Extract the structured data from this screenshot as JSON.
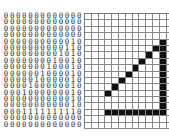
{
  "figure": {
    "rows": [
      "0000000000000",
      "0000000000000",
      "0000000000000",
      "0000000000000",
      "0000000000010",
      "0000000000110",
      "0000000001010",
      "0000000010010",
      "0000000100010",
      "0000001000010",
      "0000010000010",
      "0000100000010",
      "0001000000010",
      "0000000000010",
      "0000000000010",
      "0001111111110",
      "0000000000000",
      "0000000000000"
    ],
    "colors": {
      "on": "#111111",
      "off": "#ffffff",
      "grid_line": "#888888",
      "digit": "#333333"
    }
  }
}
